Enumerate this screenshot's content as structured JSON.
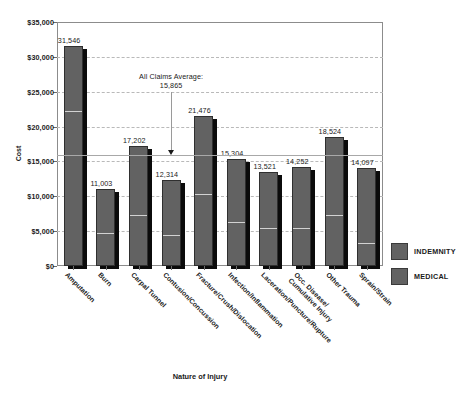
{
  "chart_data": {
    "type": "bar",
    "title": "",
    "xlabel": "Nature of Injury",
    "ylabel": "Cost",
    "ylim": [
      0,
      35000
    ],
    "ytick_labels": [
      "$35,000",
      "$30,000",
      "$25,000",
      "$20,000",
      "$15,000",
      "$10,000",
      "$5,000",
      "$0"
    ],
    "ytick_values": [
      35000,
      30000,
      25000,
      20000,
      15000,
      10000,
      5000,
      0
    ],
    "grid": true,
    "legend_position": "right",
    "stacked": true,
    "categories": [
      "Amputation",
      "Burn",
      "Carpal Tunnel",
      "Contusion/Concussion",
      "Fracture/Crush/Dislocation",
      "Infection/Inflammation",
      "Laceration/Puncture/Rupture",
      "Occ. Disease/|Cumulative Injury",
      "Other Trauma",
      "Sprain/Strain"
    ],
    "totals": [
      31546,
      11003,
      17202,
      12314,
      21476,
      15304,
      13521,
      14252,
      18524,
      14097
    ],
    "total_labels": [
      "31,546",
      "11,003",
      "17,202",
      "12,314",
      "21,476",
      "15,304",
      "13,521",
      "14,252",
      "18,524",
      "14,097"
    ],
    "series": [
      {
        "name": "MEDICAL",
        "values": [
          21900,
          4500,
          7000,
          4200,
          10000,
          6000,
          5200,
          5200,
          7100,
          3000
        ]
      },
      {
        "name": "INDEMNITY",
        "values": [
          9646,
          6503,
          10202,
          8114,
          11476,
          9304,
          8321,
          9052,
          11424,
          11097
        ]
      }
    ],
    "annotation": {
      "line1": "All Claims Average:",
      "line2": "15,865",
      "value": 15865
    }
  },
  "legend": {
    "items": [
      {
        "label": "INDEMNITY",
        "color": "#626262"
      },
      {
        "label": "MEDICAL",
        "color": "#626262"
      }
    ]
  }
}
